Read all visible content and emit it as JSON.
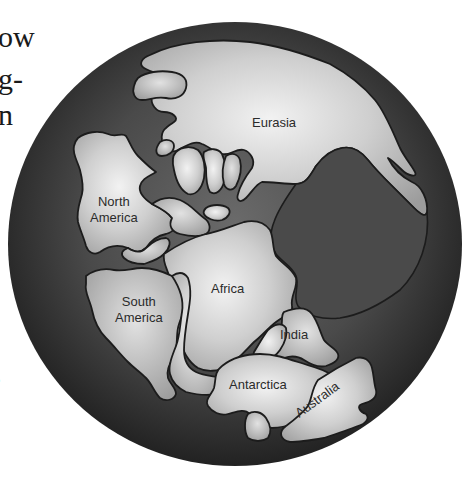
{
  "figure": {
    "colors": {
      "background": "#ffffff",
      "ocean_dark": "#2a2a2a",
      "ocean_mid": "#5a5a5a",
      "land_light": "#e6e6e6",
      "land_mid": "#b4b4b4",
      "coastline": "#1c1c1c",
      "label_text": "#2b2b2b"
    },
    "continents": [
      {
        "name": "Eurasia",
        "lines": [
          "Eurasia"
        ]
      },
      {
        "name": "North America",
        "lines": [
          "North",
          "America"
        ]
      },
      {
        "name": "South America",
        "lines": [
          "South",
          "America"
        ]
      },
      {
        "name": "Africa",
        "lines": [
          "Africa"
        ]
      },
      {
        "name": "India",
        "lines": [
          "India"
        ]
      },
      {
        "name": "Antarctica",
        "lines": [
          "Antarctica"
        ]
      },
      {
        "name": "Australia",
        "lines": [
          "Australia"
        ]
      }
    ]
  },
  "cropped_text": {
    "fragments": [
      "ow",
      "g-",
      "n",
      "e"
    ]
  }
}
